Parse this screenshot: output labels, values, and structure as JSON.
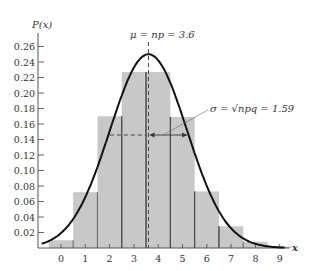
{
  "chart_data": {
    "type": "bar",
    "title": "",
    "ylabel": "P(x)",
    "xlabel": "x",
    "categories": [
      "0",
      "1",
      "2",
      "3",
      "4",
      "5",
      "6",
      "7",
      "8",
      "9"
    ],
    "values": [
      0.01,
      0.072,
      0.17,
      0.227,
      0.227,
      0.169,
      0.073,
      0.028,
      0.008,
      0.002
    ],
    "ylim": [
      0,
      0.27
    ],
    "xlim": [
      -0.9,
      9.5
    ],
    "y_ticks": [
      "0.02",
      "0.04",
      "0.06",
      "0.08",
      "0.10",
      "0.12",
      "0.14",
      "0.16",
      "0.18",
      "0.20",
      "0.22",
      "0.24",
      "0.26"
    ],
    "x_ticks": [
      "0",
      "1",
      "2",
      "3",
      "4",
      "5",
      "6",
      "7",
      "8",
      "9"
    ],
    "grid": false,
    "overlay_curve": {
      "type": "normal",
      "mean": 3.6,
      "sd": 1.59,
      "peak": 0.25
    },
    "annotations": [
      {
        "text": "μ = np = 3.6",
        "x": 3.6
      },
      {
        "text": "σ = √npq = 1.59",
        "x": 4.4,
        "y": 0.145
      }
    ]
  },
  "labels": {
    "ylabel": "P(x)",
    "xlabel": "x",
    "mu": "μ = np = 3.6",
    "sigma": "σ = √npq = 1.59"
  }
}
